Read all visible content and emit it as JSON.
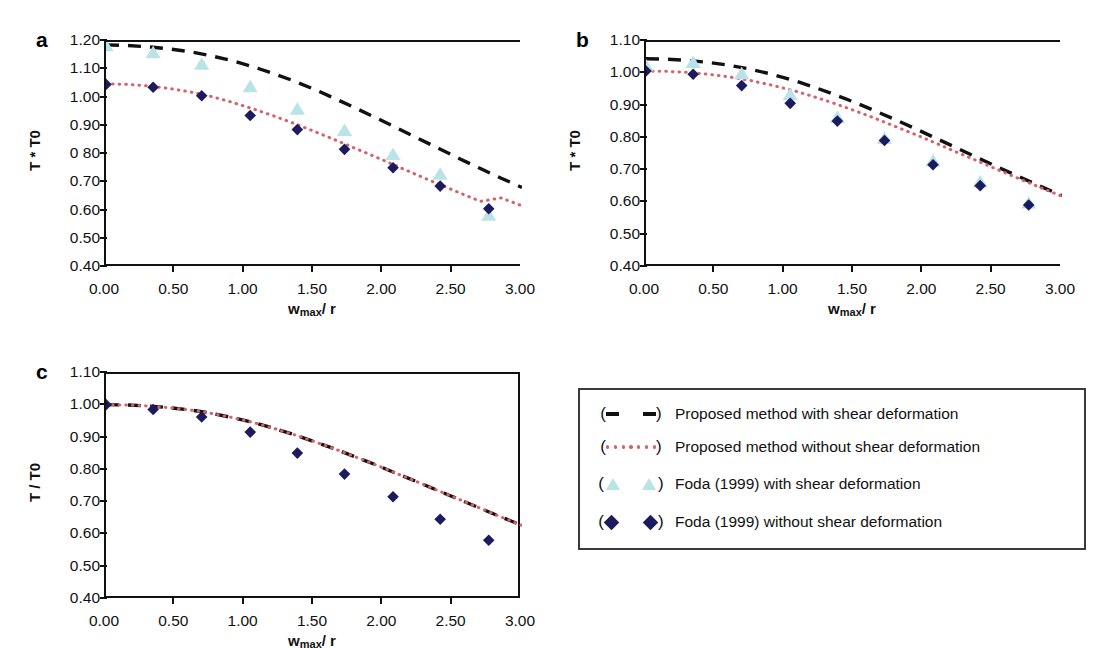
{
  "figure": {
    "panels": [
      {
        "letter": "a",
        "xlabel_main": "w",
        "xlabel_sub": "max",
        "xlabel_tail": "/ r",
        "ylabel": "T * T0",
        "yticks": [
          "1.20",
          "1.10",
          "1.00",
          "0.90",
          "0 80",
          "0.70",
          "0.60",
          "0.50",
          "0.40"
        ],
        "xticks": [
          "0.00",
          "0.50",
          "1.00",
          "1.50",
          "2.00",
          "2.50",
          "3.00"
        ]
      },
      {
        "letter": "b",
        "xlabel_main": "w",
        "xlabel_sub": "max",
        "xlabel_tail": "/ r",
        "ylabel": "T * T0",
        "yticks": [
          "1.10",
          "1.00",
          "0.90",
          "0.80",
          "0.70",
          "0.60",
          "0.50",
          "0.40"
        ],
        "xticks": [
          "0.00",
          "0.50",
          "1.00",
          "1.50",
          "2.00",
          "2.50",
          "3.00"
        ]
      },
      {
        "letter": "c",
        "xlabel_main": "w",
        "xlabel_sub": "max",
        "xlabel_tail": "/ r",
        "ylabel": "T / T0",
        "yticks": [
          "1.10",
          "1.00",
          "0.90",
          "0.80",
          "0.70",
          "0.60",
          "0.50",
          "0.40"
        ],
        "xticks": [
          "0.00",
          "0.50",
          "1.00",
          "1.50",
          "2.00",
          "2.50",
          "3.00"
        ]
      }
    ],
    "legend": {
      "items": [
        {
          "key": "black-dashed-line",
          "label": "Proposed method with shear deformation"
        },
        {
          "key": "red-dotted-line",
          "label": "Proposed method without shear deformation"
        },
        {
          "key": "cyan-triangle",
          "label": "Foda (1999) with shear deformation"
        },
        {
          "key": "navy-diamond",
          "label": "Foda (1999) without shear deformation"
        }
      ]
    },
    "colors": {
      "dashed_line": "#111111",
      "dotted_line": "#d4626a",
      "triangle_marker": "#b9e3e6",
      "diamond_marker": "#1b1b5e",
      "axis": "#111111",
      "legend_border": "#3a3a3a"
    }
  },
  "chart_data": [
    {
      "panel": "a",
      "type": "line",
      "title": "",
      "xlabel": "w_max / r",
      "ylabel": "T / T0",
      "xlim": [
        0.0,
        3.0
      ],
      "ylim": [
        0.4,
        1.2
      ],
      "grid": false,
      "legend_position": "external-bottom-right",
      "series": [
        {
          "name": "Proposed method with shear deformation",
          "style": "dashed",
          "color": "#111111",
          "x": [
            0.0,
            0.15,
            0.3,
            0.45,
            0.6,
            0.75,
            0.9,
            1.05,
            1.2,
            1.35,
            1.5,
            1.65,
            1.8,
            1.95,
            2.1,
            2.25,
            2.4,
            2.55,
            2.7,
            2.85,
            3.0
          ],
          "y": [
            1.19,
            1.188,
            1.183,
            1.176,
            1.166,
            1.152,
            1.135,
            1.114,
            1.09,
            1.063,
            1.033,
            1.0,
            0.966,
            0.931,
            0.895,
            0.859,
            0.823,
            0.787,
            0.752,
            0.718,
            0.685
          ]
        },
        {
          "name": "Proposed method without shear deformation",
          "style": "dotted",
          "color": "#d4626a",
          "x": [
            0.0,
            0.15,
            0.3,
            0.45,
            0.6,
            0.75,
            0.9,
            1.05,
            1.2,
            1.35,
            1.5,
            1.65,
            1.8,
            1.95,
            2.1,
            2.25,
            2.4,
            2.55,
            2.7,
            2.85,
            3.0
          ],
          "y": [
            1.052,
            1.05,
            1.045,
            1.036,
            1.024,
            1.008,
            0.988,
            0.965,
            0.94,
            0.913,
            0.884,
            0.854,
            0.823,
            0.792,
            0.76,
            0.728,
            0.697,
            0.666,
            0.636,
            0.648,
            0.62
          ]
        },
        {
          "name": "Foda (1999) with shear deformation",
          "style": "markers",
          "marker": "triangle",
          "color": "#b9e3e6",
          "x": [
            0.0,
            0.34,
            0.69,
            1.04,
            1.38,
            1.72,
            2.07,
            2.41,
            2.76
          ],
          "y": [
            1.185,
            1.16,
            1.12,
            1.04,
            0.96,
            0.885,
            0.8,
            0.73,
            0.585
          ]
        },
        {
          "name": "Foda (1999) without shear deformation",
          "style": "markers",
          "marker": "diamond",
          "color": "#1b1b5e",
          "x": [
            0.0,
            0.34,
            0.69,
            1.04,
            1.38,
            1.72,
            2.07,
            2.41,
            2.76
          ],
          "y": [
            1.05,
            1.04,
            1.01,
            0.94,
            0.89,
            0.82,
            0.755,
            0.69,
            0.61
          ]
        }
      ]
    },
    {
      "panel": "b",
      "type": "line",
      "title": "",
      "xlabel": "w_max / r",
      "ylabel": "T / T0",
      "xlim": [
        0.0,
        3.0
      ],
      "ylim": [
        0.4,
        1.1
      ],
      "grid": false,
      "legend_position": "external-bottom-right",
      "series": [
        {
          "name": "Proposed method with shear deformation",
          "style": "dashed",
          "color": "#111111",
          "x": [
            0.0,
            0.15,
            0.3,
            0.45,
            0.6,
            0.75,
            0.9,
            1.05,
            1.2,
            1.35,
            1.5,
            1.65,
            1.8,
            1.95,
            2.1,
            2.25,
            2.4,
            2.55,
            2.7,
            2.85,
            3.0
          ],
          "y": [
            1.048,
            1.047,
            1.043,
            1.037,
            1.028,
            1.016,
            1.001,
            0.983,
            0.962,
            0.939,
            0.914,
            0.887,
            0.859,
            0.83,
            0.8,
            0.77,
            0.74,
            0.71,
            0.681,
            0.652,
            0.624
          ]
        },
        {
          "name": "Proposed method without shear deformation",
          "style": "dotted",
          "color": "#d4626a",
          "x": [
            0.0,
            0.15,
            0.3,
            0.45,
            0.6,
            0.75,
            0.9,
            1.05,
            1.2,
            1.35,
            1.5,
            1.65,
            1.8,
            1.95,
            2.1,
            2.25,
            2.4,
            2.55,
            2.7,
            2.85,
            3.0
          ],
          "y": [
            1.01,
            1.009,
            1.006,
            1.0,
            0.992,
            0.981,
            0.967,
            0.951,
            0.932,
            0.911,
            0.888,
            0.864,
            0.838,
            0.812,
            0.785,
            0.757,
            0.73,
            0.702,
            0.675,
            0.648,
            0.622
          ]
        },
        {
          "name": "Foda (1999) with shear deformation",
          "style": "markers",
          "marker": "triangle",
          "color": "#b9e3e6",
          "x": [
            0.0,
            0.34,
            0.69,
            1.04,
            1.38,
            1.72,
            2.07,
            2.41,
            2.76
          ],
          "y": [
            1.025,
            1.035,
            1.0,
            0.935,
            0.865,
            0.8,
            0.73,
            0.665,
            0.6
          ]
        },
        {
          "name": "Foda (1999) without shear deformation",
          "style": "markers",
          "marker": "diamond",
          "color": "#1b1b5e",
          "x": [
            0.0,
            0.34,
            0.69,
            1.04,
            1.38,
            1.72,
            2.07,
            2.41,
            2.76
          ],
          "y": [
            1.01,
            1.0,
            0.965,
            0.91,
            0.855,
            0.795,
            0.72,
            0.655,
            0.595
          ]
        }
      ]
    },
    {
      "panel": "c",
      "type": "line",
      "title": "",
      "xlabel": "w_max / r",
      "ylabel": "T / T0",
      "xlim": [
        0.0,
        3.0
      ],
      "ylim": [
        0.4,
        1.1
      ],
      "grid": false,
      "legend_position": "external-right",
      "series": [
        {
          "name": "Proposed method with shear deformation",
          "style": "dashed",
          "color": "#111111",
          "x": [
            0.0,
            0.15,
            0.3,
            0.45,
            0.6,
            0.75,
            0.9,
            1.05,
            1.2,
            1.35,
            1.5,
            1.65,
            1.8,
            1.95,
            2.1,
            2.25,
            2.4,
            2.55,
            2.7,
            2.85,
            3.0
          ],
          "y": [
            1.005,
            1.004,
            1.001,
            0.996,
            0.989,
            0.979,
            0.966,
            0.951,
            0.933,
            0.913,
            0.891,
            0.868,
            0.843,
            0.818,
            0.791,
            0.765,
            0.738,
            0.711,
            0.684,
            0.657,
            0.631
          ]
        },
        {
          "name": "Proposed method without shear deformation",
          "style": "dotted",
          "color": "#d4626a",
          "x": [
            0.0,
            0.15,
            0.3,
            0.45,
            0.6,
            0.75,
            0.9,
            1.05,
            1.2,
            1.35,
            1.5,
            1.65,
            1.8,
            1.95,
            2.1,
            2.25,
            2.4,
            2.55,
            2.7,
            2.85,
            3.0
          ],
          "y": [
            1.005,
            1.004,
            1.001,
            0.996,
            0.989,
            0.979,
            0.966,
            0.951,
            0.933,
            0.913,
            0.891,
            0.868,
            0.843,
            0.818,
            0.791,
            0.765,
            0.738,
            0.711,
            0.684,
            0.657,
            0.631
          ]
        },
        {
          "name": "Foda (1999) without shear deformation",
          "style": "markers",
          "marker": "diamond",
          "color": "#1b1b5e",
          "x": [
            0.0,
            0.34,
            0.69,
            1.04,
            1.38,
            1.72,
            2.07,
            2.41,
            2.76
          ],
          "y": [
            1.005,
            0.99,
            0.967,
            0.92,
            0.855,
            0.79,
            0.72,
            0.65,
            0.585
          ]
        }
      ]
    }
  ]
}
